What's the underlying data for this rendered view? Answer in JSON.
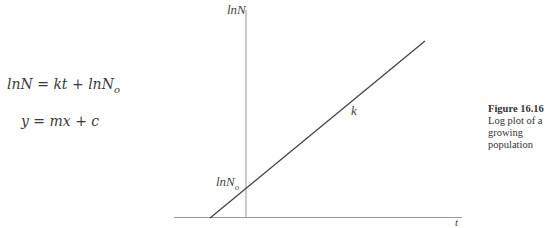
{
  "equations": [
    {
      "lhs": "lnN",
      "rhs_main": "kt + lnN",
      "rhs_sub": "o"
    },
    {
      "text": "y = mx + c"
    }
  ],
  "diagram": {
    "y_axis_label": "lnN",
    "x_axis_label": "t",
    "intercept_label_main": "lnN",
    "intercept_label_sub": "o",
    "slope_label": "k",
    "line_color": "#444444",
    "axis_color": "#999999"
  },
  "caption": {
    "figure_number": "Figure 16.16",
    "text_line1": "Log plot of a",
    "text_line2": "growing population"
  }
}
